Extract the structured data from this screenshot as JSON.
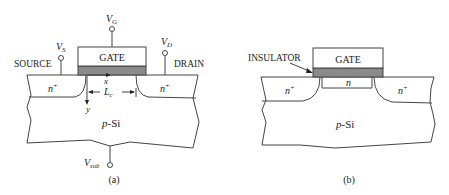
{
  "figure_a": {
    "caption": "(a)",
    "gate_label": "GATE",
    "source_label": "SOURCE",
    "drain_label": "DRAIN",
    "vg": {
      "base": "V",
      "sub": "G"
    },
    "vs": {
      "base": "V",
      "sub": "S"
    },
    "vd": {
      "base": "V",
      "sub": "D"
    },
    "vsub": {
      "base": "V",
      "sub": "sub"
    },
    "source_region": {
      "base": "n",
      "sup": "+"
    },
    "drain_region": {
      "base": "n",
      "sup": "+"
    },
    "x_axis": "x",
    "y_axis": "y",
    "channel_length": {
      "base": "L",
      "sub": "c"
    },
    "substrate": "p-Si"
  },
  "figure_b": {
    "caption": "(b)",
    "gate_label": "GATE",
    "insulator_label": "INSULATOR",
    "source_region": {
      "base": "n",
      "sup": "+"
    },
    "drain_region": {
      "base": "n",
      "sup": "+"
    },
    "channel_region": "n",
    "substrate": "p-Si"
  },
  "colors": {
    "insulator": "#8a8a8a",
    "line": "#444444"
  }
}
